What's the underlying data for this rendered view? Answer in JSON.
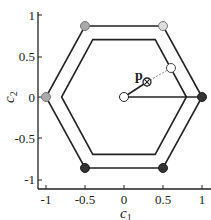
{
  "figure": {
    "x_axis": {
      "label": "c",
      "label_sub": "1",
      "ticks": [
        "-1",
        "-0.5",
        "0",
        "0.5",
        "1"
      ]
    },
    "y_axis": {
      "label": "c",
      "label_sub": "2",
      "ticks": [
        "1",
        "0.5",
        "0",
        "-0.5",
        "-1"
      ]
    },
    "point_label": "p",
    "outer_hexagon_vertices": [
      [
        1,
        0
      ],
      [
        0.5,
        0.866
      ],
      [
        -0.5,
        0.866
      ],
      [
        -1,
        0
      ],
      [
        -0.5,
        -0.866
      ],
      [
        0.5,
        -0.866
      ]
    ],
    "inner_hexagon_vertices": [
      [
        0.8,
        0
      ],
      [
        0.4,
        0.7
      ],
      [
        -0.4,
        0.7
      ],
      [
        -0.8,
        0
      ],
      [
        -0.4,
        -0.7
      ],
      [
        0.4,
        -0.7
      ]
    ],
    "vertex_markers": [
      {
        "pos": [
          1,
          0
        ],
        "color": "#333333"
      },
      {
        "pos": [
          0.5,
          0.866
        ],
        "color": "#dddddd"
      },
      {
        "pos": [
          -0.5,
          0.866
        ],
        "color": "#aaaaaa"
      },
      {
        "pos": [
          -1,
          0
        ],
        "color": "#aaaaaa"
      },
      {
        "pos": [
          -0.5,
          -0.866
        ],
        "color": "#333333"
      },
      {
        "pos": [
          0.5,
          -0.866
        ],
        "color": "#333333"
      }
    ],
    "origin_marker": {
      "pos": [
        0,
        0
      ],
      "fill": "#ffffff"
    },
    "p_point": [
      0.3,
      0.18
    ],
    "projection_marker": {
      "pos": [
        0.6,
        0.35
      ],
      "fill": "#ffffff"
    }
  }
}
